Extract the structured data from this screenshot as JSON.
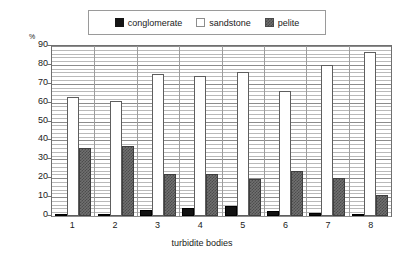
{
  "chart_data": {
    "type": "bar",
    "title": "",
    "xlabel": "turbidite bodies",
    "ylabel": "%",
    "unit_label": "%",
    "categories": [
      "1",
      "2",
      "3",
      "4",
      "5",
      "6",
      "7",
      "8"
    ],
    "series": [
      {
        "name": "conglomerate",
        "color": "#121212",
        "values": [
          1,
          0.8,
          3,
          4,
          5.5,
          2.5,
          1.5,
          0.5
        ]
      },
      {
        "name": "sandstone",
        "color": "#ffffff",
        "values": [
          63,
          61,
          75,
          74,
          76,
          66,
          80,
          87
        ]
      },
      {
        "name": "pelite",
        "color": "#707070",
        "values": [
          36,
          37,
          22,
          22.5,
          19.5,
          24,
          20,
          11
        ]
      }
    ],
    "ylim": [
      0,
      90
    ],
    "yticks": [
      0,
      10,
      20,
      30,
      40,
      50,
      60,
      70,
      80,
      90
    ],
    "ytick_labels": [
      "0",
      "10",
      "20",
      "30",
      "40",
      "50",
      "60",
      "70",
      "80",
      "90"
    ],
    "minor_tick_step": 2,
    "grid": true,
    "legend_position": "top-center",
    "legend_entries": [
      "conglomerate",
      "sandstone",
      "pelite"
    ]
  },
  "legend": {
    "items": [
      {
        "label": "conglomerate",
        "swatch": "conglomerate-swatch-icon"
      },
      {
        "label": "sandstone",
        "swatch": "sandstone-swatch-icon"
      },
      {
        "label": "pelite",
        "swatch": "pelite-swatch-icon"
      }
    ]
  },
  "axes": {
    "y_unit": "%",
    "x_title": "turbidite bodies"
  }
}
